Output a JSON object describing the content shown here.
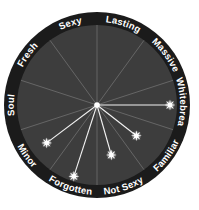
{
  "chart_data": {
    "type": "radial",
    "title": "",
    "center": [
      97,
      105
    ],
    "outer_radius": 93,
    "inner_radius": 80,
    "max_value": 80,
    "grid": true,
    "categories": [
      "Lasting",
      "Massive",
      "Whitebread",
      "Familiar",
      "Not Sexy",
      "Forgotten",
      "Minor",
      "Soul",
      "Fresh",
      "Sexy"
    ],
    "category_angles_deg": [
      18,
      54,
      90,
      126,
      162,
      198,
      234,
      270,
      306,
      342
    ],
    "gridline_angles_deg": [
      0,
      36,
      72,
      108,
      144,
      180,
      216,
      252,
      288,
      324
    ],
    "points": [
      {
        "category": "Whitebread",
        "angle_deg": 90,
        "value": 73
      },
      {
        "category": "Familiar",
        "angle_deg": 128,
        "value": 50
      },
      {
        "category": "Not Sexy",
        "angle_deg": 164,
        "value": 52
      },
      {
        "category": "Forgotten",
        "angle_deg": 198,
        "value": 75
      },
      {
        "category": "Minor",
        "angle_deg": 233,
        "value": 63
      }
    ],
    "colors": {
      "ring": "#1b1b1b",
      "disk": "#3d3d3d",
      "gridline": "#707070",
      "data_line": "#f2f2f2",
      "label": "#ffffff"
    }
  }
}
